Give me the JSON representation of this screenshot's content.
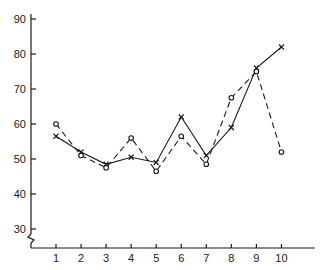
{
  "chart_data": {
    "type": "line",
    "title": "",
    "xlabel": "",
    "ylabel": "",
    "x": [
      1,
      2,
      3,
      4,
      5,
      6,
      7,
      8,
      9,
      10
    ],
    "x_tick_labels": [
      "1",
      "2",
      "3",
      "4",
      "5",
      "6",
      "7",
      "8",
      "9",
      "10"
    ],
    "y_tick_values": [
      30,
      40,
      50,
      60,
      70,
      80,
      90
    ],
    "y_tick_labels": [
      "30",
      "40",
      "50",
      "60",
      "70",
      "80",
      "90"
    ],
    "ylim": [
      27,
      90
    ],
    "y_axis_break": true,
    "grid": false,
    "legend": null,
    "series": [
      {
        "name": "solid-cross",
        "line_style": "solid",
        "marker": "x",
        "values": [
          56.5,
          52,
          48.5,
          50.5,
          49,
          62,
          51,
          59,
          76,
          82
        ]
      },
      {
        "name": "dashed-circle",
        "line_style": "dashed",
        "marker": "o",
        "values": [
          60,
          51,
          47.5,
          56,
          46.5,
          56.5,
          48.5,
          67.5,
          75,
          52
        ]
      }
    ],
    "colors": {
      "ink": "#1a1a1a",
      "background": "#ffffff"
    }
  }
}
